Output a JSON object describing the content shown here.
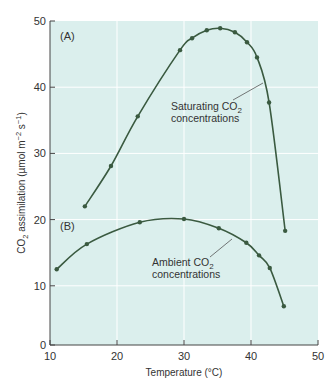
{
  "chart_data": {
    "type": "line",
    "title": "",
    "xlabel": "Temperature (°C)",
    "ylabel": "CO2 assimilation (µmol m-2 s-1)",
    "xlim": [
      10,
      50
    ],
    "ylim": [
      0,
      50
    ],
    "xticks": [
      10,
      20,
      30,
      40,
      50
    ],
    "yticks": [
      0,
      10,
      20,
      30,
      40,
      50
    ],
    "grid": true,
    "legend": "none (inline annotations)",
    "background": "#dbefed",
    "line_color": "#3a5a40",
    "series": [
      {
        "name": "Saturating CO2 concentrations",
        "panel_label": "(A)",
        "x": [
          15.2,
          19.1,
          23.1,
          29.4,
          31.2,
          33.4,
          35.4,
          37.6,
          39.4,
          40.9,
          42.7,
          45.1
        ],
        "y": [
          22.0,
          28.1,
          35.6,
          45.6,
          47.4,
          48.6,
          48.9,
          48.3,
          46.8,
          44.5,
          37.7,
          18.3
        ]
      },
      {
        "name": "Ambient CO2 concentrations",
        "panel_label": "(B)",
        "x": [
          11.0,
          15.5,
          23.4,
          30.0,
          35.2,
          39.3,
          41.2,
          42.8,
          44.9
        ],
        "y": [
          12.5,
          16.3,
          19.6,
          20.1,
          18.7,
          16.5,
          14.6,
          12.7,
          6.9
        ]
      }
    ],
    "annotations": [
      {
        "text_line1": "Saturating CO",
        "sub": "2",
        "text_line2": "concentrations",
        "x": 34,
        "y": 32
      },
      {
        "text_line1": "Ambient CO",
        "sub": "2",
        "text_line2": "concentrations",
        "x": 29,
        "y": 14
      }
    ]
  },
  "labels": {
    "panel_a": "(A)",
    "panel_b": "(B)",
    "x_title": "Temperature (°C)",
    "y_title_prefix": "CO",
    "y_title_sub": "2",
    "y_title_main": " assimilation (µmol m",
    "y_title_exp1": "−2",
    "y_title_mid": " s",
    "y_title_exp2": "−1",
    "y_title_end": ")",
    "annot_a_line1": "Saturating CO",
    "annot_a_sub": "2",
    "annot_a_line2": "concentrations",
    "annot_b_line1": "Ambient CO",
    "annot_b_sub": "2",
    "annot_b_line2": "concentrations"
  }
}
